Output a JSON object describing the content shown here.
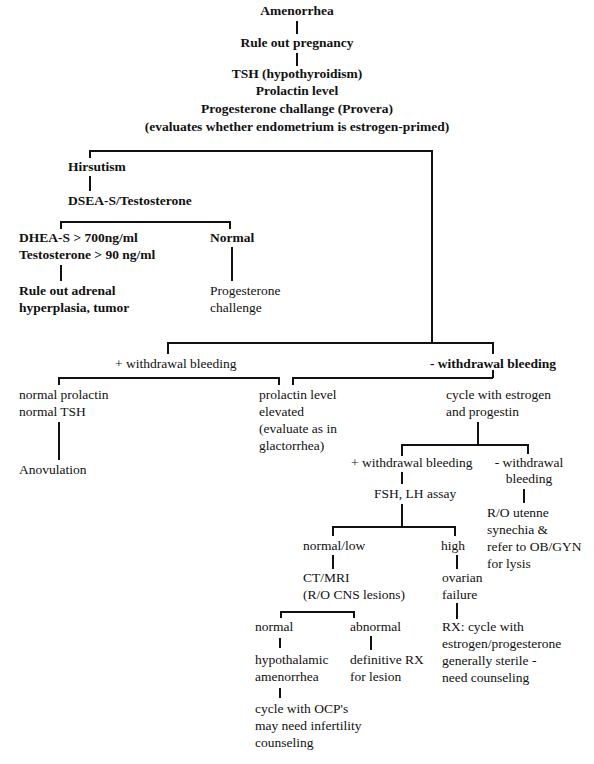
{
  "root": {
    "title": "Amenorrhea",
    "step1": "Rule out pregnancy",
    "step2_lines": [
      "TSH (hypothyroidism)",
      "Prolactin level",
      "Progesterone challange (Provera)",
      "(evaluates whether endometrium is estrogen-primed)"
    ]
  },
  "hirsutism_branch": {
    "label": "Hirsutism",
    "test": "DSEA-S/Testosterone",
    "elevated": {
      "lines": [
        "DHEA-S > 700ng/ml",
        "Testosterone > 90 ng/ml"
      ],
      "outcome": [
        "Rule out adrenal",
        "hyperplasia, tumor"
      ]
    },
    "normal": {
      "label": "Normal",
      "outcome": [
        "Progesterone",
        "challenge"
      ]
    }
  },
  "pos_withdrawal": {
    "label": "+ withdrawal bleeding",
    "left": {
      "lines": [
        "normal prolactin",
        "normal TSH"
      ],
      "outcome": "Anovulation"
    },
    "right": {
      "lines": [
        "prolactin level",
        "elevated",
        "(evaluate as in",
        "glactorrhea)"
      ]
    }
  },
  "neg_withdrawal": {
    "label": "- withdrawal bleeding",
    "cycle": [
      "cycle with estrogen",
      "and progestin"
    ],
    "pos": {
      "label": "+ withdrawal bleeding",
      "assay": "FSH, LH assay",
      "normal_low": {
        "label": "normal/low",
        "imaging": [
          "CT/MRI",
          "(R/O CNS lesions)"
        ],
        "normal": {
          "label": "normal",
          "dx": [
            "hypothalamic",
            "amenorrhea"
          ],
          "tx": [
            "cycle with OCP's",
            "may need infertility",
            "counseling"
          ]
        },
        "abnormal": {
          "label": "abnormal",
          "tx": [
            "definitive RX",
            "for lesion"
          ]
        }
      },
      "high": {
        "label": "high",
        "dx": [
          "ovarian",
          "failure"
        ],
        "tx": [
          "RX: cycle with",
          "estrogen/progesterone",
          "generally sterile -",
          "need counseling"
        ]
      }
    },
    "neg": {
      "label_lines": [
        "- withdrawal",
        "bleeding"
      ],
      "outcome": [
        "R/O utenne",
        "synechia &",
        "refer to OB/GYN",
        "for lysis"
      ]
    }
  }
}
